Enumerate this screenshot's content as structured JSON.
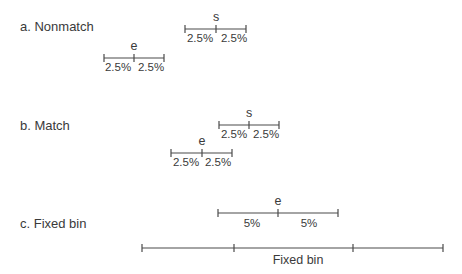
{
  "panels": [
    {
      "label": "a. Nonmatch",
      "intervals": [
        {
          "symbol": "s",
          "left_label": "2.5%",
          "right_label": "2.5%"
        },
        {
          "symbol": "e",
          "left_label": "2.5%",
          "right_label": "2.5%"
        }
      ]
    },
    {
      "label": "b. Match",
      "intervals": [
        {
          "symbol": "s",
          "left_label": "2.5%",
          "right_label": "2.5%"
        },
        {
          "symbol": "e",
          "left_label": "2.5%",
          "right_label": "2.5%"
        }
      ]
    },
    {
      "label": "c. Fixed bin",
      "intervals": [
        {
          "symbol": "e",
          "left_label": "5%",
          "right_label": "5%"
        }
      ],
      "bin": {
        "label": "Fixed bin"
      }
    }
  ]
}
